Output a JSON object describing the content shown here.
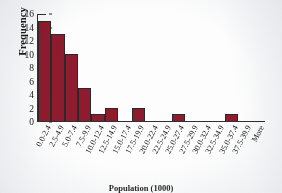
{
  "chart_data": {
    "type": "bar",
    "title": "",
    "xlabel": "Population (1000)",
    "ylabel": "Frequency",
    "ylim": [
      0,
      16
    ],
    "yticks": [
      0,
      2,
      4,
      6,
      8,
      10,
      12,
      14,
      16
    ],
    "grid": false,
    "legend": false,
    "bar_color": "#8e1b2e",
    "bar_edge_color": "#2a2a2a",
    "categories": [
      "0.0-2.4",
      "2.5-4.9",
      "5.0-7.4",
      "7.5-9.9",
      "10.0-12.4",
      "12.5-14.9",
      "15.0-17.4",
      "17.5-19.9",
      "20.0-22.4",
      "22.5-24.9",
      "25.0-27.4",
      "27.5-29.9",
      "30.0-32.4",
      "32.5-34.9",
      "35.0-37.4",
      "37.5-39.9",
      "More"
    ],
    "values": [
      15,
      13,
      10,
      5,
      1,
      2,
      0,
      2,
      0,
      0,
      1,
      0,
      0,
      0,
      1,
      0,
      0
    ]
  }
}
